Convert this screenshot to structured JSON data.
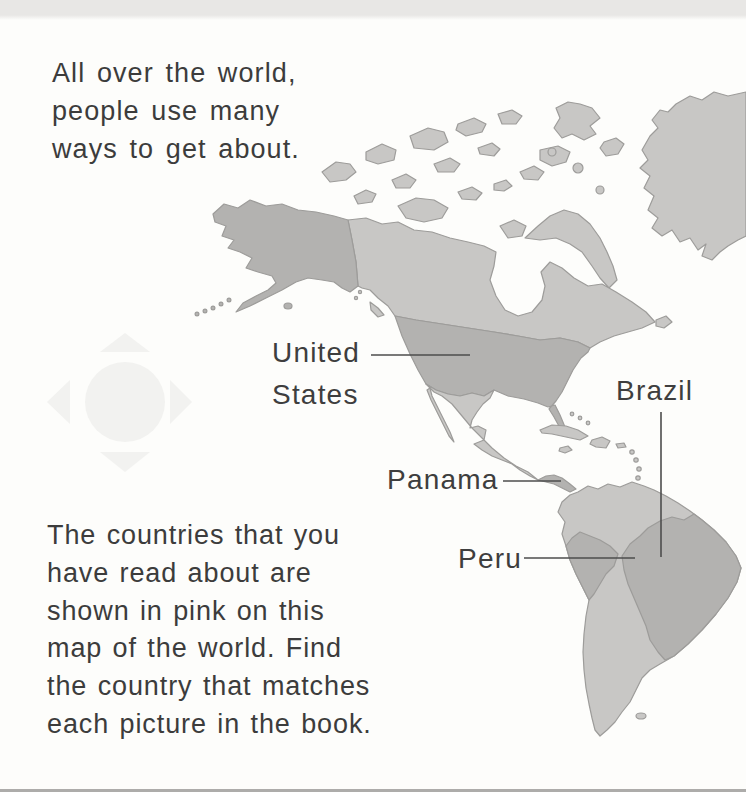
{
  "page": {
    "background": "#fdfdfb",
    "top_edge_color": "#e8e7e5",
    "bottom_rule_color": "#adacaa"
  },
  "intro_text": {
    "lines": [
      "All over the world,",
      "people use many",
      "ways to get about."
    ]
  },
  "instruction_text": {
    "lines": [
      "The countries that you",
      "have read about are",
      "shown in pink on this",
      "map of the world. Find",
      "the country that matches",
      "each picture in the book."
    ]
  },
  "map": {
    "labels": {
      "united_states": {
        "lines": [
          "United",
          "States"
        ]
      },
      "brazil": {
        "text": "Brazil"
      },
      "panama": {
        "text": "Panama"
      },
      "peru": {
        "text": "Peru"
      }
    },
    "highlighted_countries": [
      "United States",
      "Panama",
      "Peru",
      "Brazil"
    ],
    "colors": {
      "land": "#c8c7c5",
      "highlight": "#b3b2b0",
      "outline": "#9d9c9a",
      "pointer_line": "#4d4d4d",
      "label_text": "#3e3e3e"
    }
  },
  "watermark": {
    "icon": "compass-rose",
    "color": "#f2f2f0"
  }
}
